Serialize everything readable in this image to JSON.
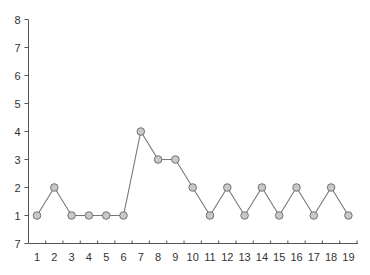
{
  "chart_data": {
    "type": "line",
    "title": "",
    "xlabel": "",
    "ylabel": "",
    "x": [
      1,
      2,
      3,
      4,
      5,
      6,
      7,
      8,
      9,
      10,
      11,
      12,
      13,
      14,
      15,
      16,
      17,
      18,
      19
    ],
    "values": [
      1,
      2,
      1,
      1,
      1,
      1,
      4,
      3,
      3,
      2,
      1,
      2,
      1,
      2,
      1,
      2,
      1,
      2,
      1
    ],
    "y_ticks": [
      0,
      1,
      2,
      3,
      4,
      5,
      6,
      7,
      8
    ],
    "y_tick_labels": [
      "7",
      "1",
      "2",
      "3",
      "4",
      "5",
      "6",
      "7",
      "8"
    ],
    "x_tick_labels": [
      "1",
      "2",
      "3",
      "4",
      "5",
      "6",
      "7",
      "8",
      "9",
      "10",
      "11",
      "12",
      "13",
      "14",
      "15",
      "16",
      "17",
      "18",
      "19"
    ],
    "ylim": [
      0,
      8
    ],
    "xlim": [
      0.5,
      19.5
    ],
    "grid": false,
    "legend": null,
    "colors": {
      "line": "#777777",
      "marker_fill": "#c8c8c8",
      "marker_stroke": "#666666",
      "axis": "#555555"
    }
  }
}
